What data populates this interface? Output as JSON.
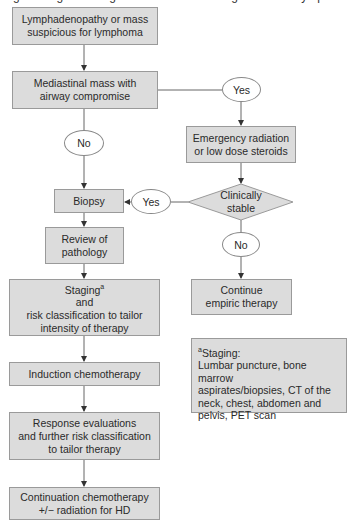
{
  "title": "Fig. Management algorithm for children diagnosed with lymphoma",
  "nodes": {
    "start": [
      "Lymphadenopathy or mass",
      "suspicious for lymphoma"
    ],
    "mediastinal": [
      "Mediastinal mass with",
      "airway compromise"
    ],
    "yes1": "Yes",
    "no1": "No",
    "emergency": [
      "Emergency radiation",
      "or low dose steroids"
    ],
    "clinically_stable": [
      "Clinically",
      "stable"
    ],
    "yes2": "Yes",
    "no2": "No",
    "biopsy": "Biopsy",
    "review": [
      "Review of",
      "pathology"
    ],
    "staging_word": "Staging",
    "staging_sup": "a",
    "staging_rest": [
      "and",
      "risk classification to tailor",
      "intensity of therapy"
    ],
    "continue_empiric": [
      "Continue",
      "empiric therapy"
    ],
    "induction": "Induction chemotherapy",
    "response": [
      "Response evaluations",
      "and further risk classification",
      "to tailor therapy"
    ],
    "continuation": [
      "Continuation chemotherapy",
      "+/− radiation for HD"
    ]
  },
  "footnote": {
    "marker": "a",
    "heading": "Staging:",
    "lines": [
      "Lumbar puncture, bone marrow",
      "aspirates/biopsies, CT of the",
      "neck, chest, abdomen and",
      "pelvis, PET scan"
    ]
  },
  "colors": {
    "box_fill": "#dcdcdc",
    "box_border": "#9a9a9a",
    "line": "#555555"
  }
}
